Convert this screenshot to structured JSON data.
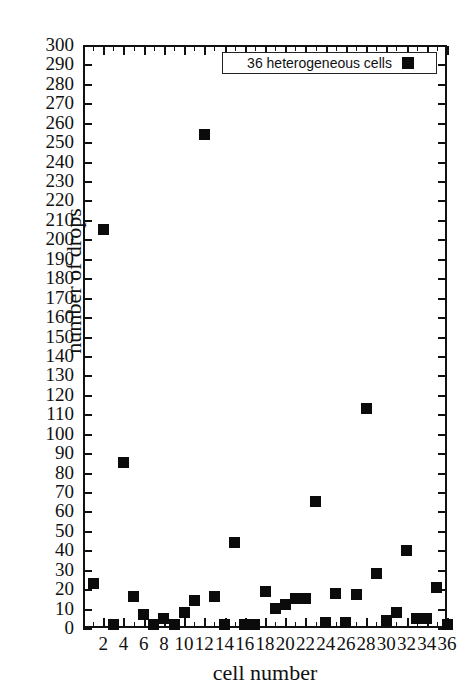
{
  "chart_data": {
    "type": "scatter",
    "title": "",
    "xlabel": "cell number",
    "ylabel": "number of drops",
    "xlim": [
      0,
      36
    ],
    "ylim": [
      0,
      300
    ],
    "xticks": [
      2,
      4,
      6,
      8,
      10,
      12,
      14,
      16,
      18,
      20,
      22,
      24,
      26,
      28,
      30,
      32,
      34,
      36
    ],
    "yticks": [
      0,
      10,
      20,
      30,
      40,
      50,
      60,
      70,
      80,
      90,
      100,
      110,
      120,
      130,
      140,
      150,
      160,
      170,
      180,
      190,
      200,
      210,
      220,
      230,
      240,
      250,
      260,
      270,
      280,
      290,
      300
    ],
    "grid": false,
    "legend_position": "top-right",
    "series": [
      {
        "name": "36 heterogeneous cells",
        "marker": "filled-square",
        "color": "#0b0b0b",
        "x": [
          1,
          2,
          3,
          4,
          5,
          6,
          7,
          8,
          9,
          10,
          11,
          12,
          13,
          14,
          15,
          16,
          17,
          18,
          19,
          20,
          21,
          22,
          23,
          24,
          25,
          26,
          27,
          28,
          29,
          30,
          31,
          32,
          33,
          34,
          35,
          36
        ],
        "values": [
          23,
          205,
          2,
          85,
          16,
          7,
          2,
          5,
          2,
          8,
          14,
          254,
          16,
          2,
          44,
          2,
          2,
          19,
          10,
          12,
          15,
          15,
          65,
          3,
          18,
          3,
          17,
          113,
          28,
          4,
          8,
          40,
          5,
          5,
          21,
          2
        ]
      }
    ]
  },
  "axes": {
    "y_label": "number of drops",
    "x_label": "cell number"
  },
  "legend": {
    "label": "36 heterogeneous cells"
  }
}
